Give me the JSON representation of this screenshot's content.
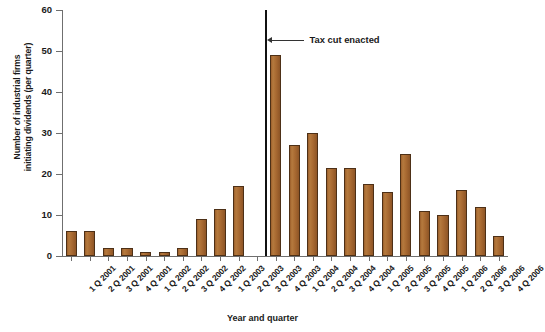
{
  "chart_data": {
    "type": "bar",
    "title": "",
    "xlabel": "Year and quarter",
    "ylabel": "Number of industrial firms initiating dividends (per quarter)",
    "ylabel_lines": [
      "Number of industrial firms",
      "initiating dividends (per quarter)"
    ],
    "ylim": [
      0,
      60
    ],
    "yticks": [
      0,
      10,
      20,
      30,
      40,
      50,
      60
    ],
    "ytick_labels": [
      "0",
      "10",
      "20",
      "30",
      "40",
      "50",
      "60"
    ],
    "grid": false,
    "legend": null,
    "bar_color": "#a96a32",
    "bar_edge_color": "#4d3017",
    "categories": [
      "1 Q 2001",
      "2 Q 2001",
      "3 Q 2001",
      "4 Q 2001",
      "1 Q 2002",
      "2 Q 2002",
      "3 Q 2002",
      "4 Q 2002",
      "1 Q 2003",
      "2 Q 2003",
      "3 Q 2003",
      "4 Q 2003",
      "1 Q 2004",
      "2 Q 2004",
      "3 Q 2004",
      "4 Q 2004",
      "1 Q 2005",
      "2 Q 2005",
      "3 Q 2005",
      "4 Q 2005",
      "1 Q 2006",
      "2 Q 2006",
      "3 Q 2006",
      "4 Q 2006"
    ],
    "values": [
      6,
      6,
      2,
      2,
      1,
      1,
      2,
      9,
      11.5,
      17,
      0,
      49,
      27,
      30,
      21.5,
      21.5,
      17.5,
      15.5,
      25,
      11,
      10,
      16,
      12,
      5
    ],
    "annotations": [
      {
        "label": "Tax cut enacted",
        "marker": "vertical-line",
        "between_categories": [
          "3 Q 2003",
          "4 Q 2003"
        ],
        "line_color": "#111111"
      }
    ]
  }
}
